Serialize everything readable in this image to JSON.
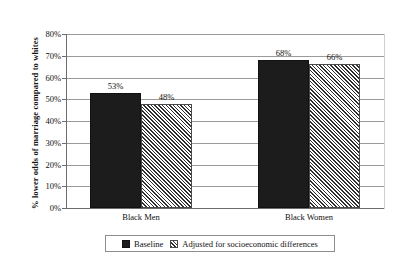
{
  "chart_data": {
    "type": "bar",
    "title": "",
    "xlabel": "",
    "ylabel": "% lower odds of marriage compared to whites",
    "ylim": [
      0,
      80
    ],
    "grid": true,
    "legend_position": "bottom",
    "categories": [
      "Black Men",
      "Black Women"
    ],
    "series": [
      {
        "name": "Baseline",
        "pattern": "solid",
        "color": "#1c1c1c",
        "values": [
          53,
          68
        ],
        "value_labels": [
          "53%",
          "68%"
        ]
      },
      {
        "name": "Adjusted for socioeconomic differences",
        "pattern": "diagonal-hatch",
        "color": "#2e2e2e",
        "values": [
          48,
          66
        ],
        "value_labels": [
          "48%",
          "66%"
        ]
      }
    ],
    "y_ticks": [
      {
        "value": 80,
        "label": "80%"
      },
      {
        "value": 70,
        "label": "70%"
      },
      {
        "value": 60,
        "label": "60%"
      },
      {
        "value": 50,
        "label": "50%"
      },
      {
        "value": 40,
        "label": "40%"
      },
      {
        "value": 30,
        "label": "30%"
      },
      {
        "value": 20,
        "label": "20%"
      },
      {
        "value": 10,
        "label": "10%"
      },
      {
        "value": 0,
        "label": "0%"
      }
    ]
  },
  "legend": {
    "items": [
      {
        "label": "Baseline"
      },
      {
        "label": "Adjusted for socioeconomic differences"
      }
    ]
  },
  "colors": {
    "series_baseline": "#1c1c1c",
    "series_adjusted": "#2e2e2e",
    "gridline": "#9a9a9a",
    "axis": "#6d6d6d",
    "background": "#ffffff"
  }
}
